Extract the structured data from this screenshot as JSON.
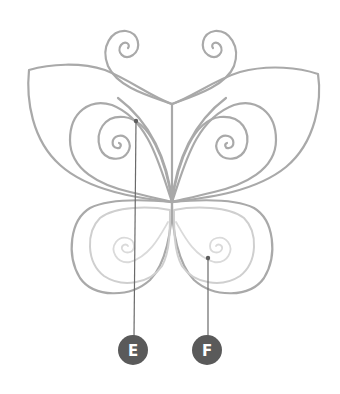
{
  "figure": {
    "colors": {
      "outline": "#a9a9a9",
      "lower_inner": "#cfcfcf",
      "lower_spiral": "#dadada",
      "leader_line": "#6a6a6a",
      "badge_fill": "#5a5a5a",
      "badge_text": "#ffffff"
    },
    "callouts": [
      {
        "label": "E",
        "target": "upper-left-inner-spiral"
      },
      {
        "label": "F",
        "target": "lower-right-spiral"
      }
    ]
  }
}
